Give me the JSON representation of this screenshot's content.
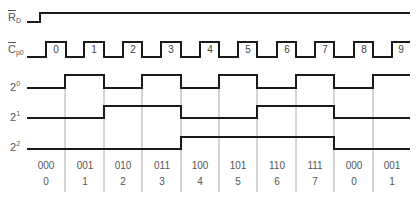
{
  "signals": [
    {
      "id": "rd",
      "label_main": "R",
      "label_sub": "D",
      "overline": true
    },
    {
      "id": "cp0",
      "label_main": "C",
      "label_sub": "p0",
      "overline": true
    },
    {
      "id": "q0",
      "label_main": "2",
      "label_sup": "0"
    },
    {
      "id": "q1",
      "label_main": "2",
      "label_sup": "1"
    },
    {
      "id": "q2",
      "label_main": "2",
      "label_sup": "2"
    }
  ],
  "clock_pulses": [
    "0",
    "1",
    "2",
    "3",
    "4",
    "5",
    "6",
    "7",
    "8",
    "9"
  ],
  "states": [
    {
      "binary": "000",
      "decimal": "0"
    },
    {
      "binary": "001",
      "decimal": "1"
    },
    {
      "binary": "010",
      "decimal": "2"
    },
    {
      "binary": "011",
      "decimal": "3"
    },
    {
      "binary": "100",
      "decimal": "4"
    },
    {
      "binary": "101",
      "decimal": "5"
    },
    {
      "binary": "110",
      "decimal": "6"
    },
    {
      "binary": "111",
      "decimal": "7"
    },
    {
      "binary": "000",
      "decimal": "0"
    },
    {
      "binary": "001",
      "decimal": "1"
    }
  ],
  "colors": {
    "line": "#1a1a1a",
    "grid": "#aaaaaa",
    "text": "#555555"
  }
}
